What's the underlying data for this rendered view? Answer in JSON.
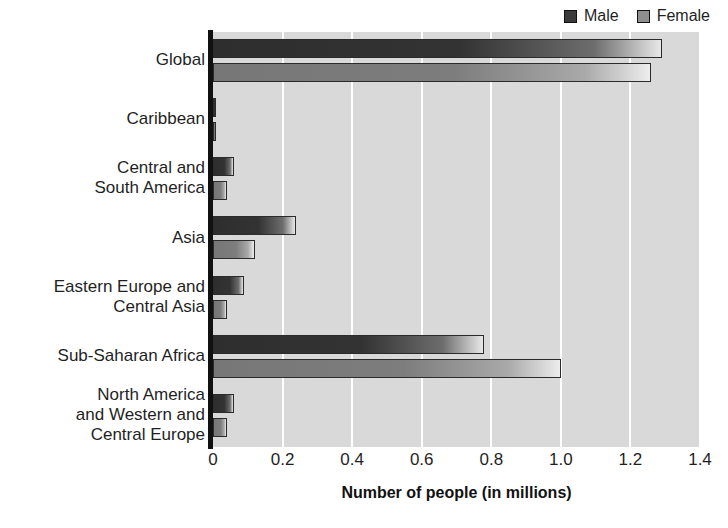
{
  "chart_data": {
    "type": "bar",
    "orientation": "horizontal",
    "title": "",
    "xlabel": "Number of people (in millions)",
    "ylabel": "",
    "xlim": [
      0,
      1.4
    ],
    "xticks": [
      "0",
      "0.2",
      "0.4",
      "0.6",
      "0.8",
      "1.0",
      "1.2",
      "1.4"
    ],
    "xtick_values": [
      0,
      0.2,
      0.4,
      0.6,
      0.8,
      1.0,
      1.2,
      1.4
    ],
    "grid": true,
    "legend_position": "top-right",
    "categories": [
      "Global",
      "Caribbean",
      "Central and\nSouth America",
      "Asia",
      "Eastern Europe and\nCentral Asia",
      "Sub-Saharan Africa",
      "North America\nand Western and\nCentral Europe"
    ],
    "series": [
      {
        "name": "Male",
        "color": "#3a3a3a",
        "values": [
          1.29,
          0.01,
          0.06,
          0.24,
          0.09,
          0.78,
          0.06
        ]
      },
      {
        "name": "Female",
        "color": "#8e8e8e",
        "values": [
          1.26,
          0.01,
          0.04,
          0.12,
          0.04,
          1.0,
          0.04
        ]
      }
    ]
  },
  "legend": {
    "items": [
      {
        "label": "Male",
        "swatch": "male-swatch"
      },
      {
        "label": "Female",
        "swatch": "female-swatch"
      }
    ]
  },
  "axis": {
    "title": "Number of people (in millions)"
  },
  "colors": {
    "plot_background": "#d9d9d9",
    "gridline": "#ffffff",
    "axis": "#111111",
    "male": "#3a3a3a",
    "female": "#8e8e8e",
    "text": "#1f1f1f"
  }
}
